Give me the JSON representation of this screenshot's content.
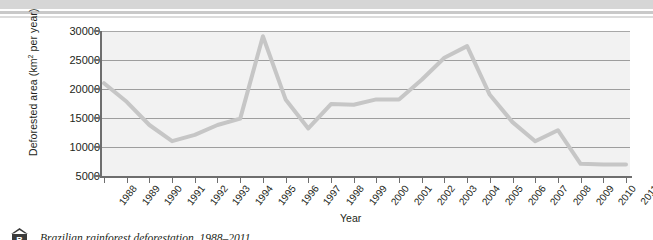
{
  "figure": {
    "badge_letter": "B",
    "caption": "Brazilian rainforest deforestation, 1988–2011",
    "ghost_text": {
      "line1": "ghost-bleed-1",
      "line2": "ghost-bleed-2",
      "line3": "ghost-bleed-3"
    }
  },
  "axes": {
    "y_title_main": "Deforested area (km",
    "y_title_sup": "2",
    "y_title_tail": " per year)",
    "x_title": "Year"
  },
  "colors": {
    "line": "#c6c6c6",
    "plot_background": "#f2f2f2",
    "gridline": "#9e9e9e",
    "axis": "#6e6e6e",
    "text": "#231f20",
    "badge": "#3b3b3b",
    "page_rule": "#d6d6d6"
  },
  "chart_data": {
    "type": "line",
    "title": "Brazilian rainforest deforestation, 1988–2011",
    "xlabel": "Year",
    "ylabel": "Deforested area (km² per year)",
    "ylim": [
      5000,
      30000
    ],
    "ytick_labels": [
      "30000",
      "25000",
      "20000",
      "15000",
      "10000",
      "5000"
    ],
    "yticks": [
      30000,
      25000,
      20000,
      15000,
      10000,
      5000
    ],
    "grid": true,
    "legend": "none",
    "categories": [
      "1988",
      "1989",
      "1990",
      "1991",
      "1992",
      "1993",
      "1994",
      "1995",
      "1996",
      "1997",
      "1998",
      "1999",
      "2000",
      "2001",
      "2002",
      "2003",
      "2004",
      "2005",
      "2006",
      "2007",
      "2008",
      "2009",
      "2010",
      "2011"
    ],
    "values": [
      21000,
      17800,
      13800,
      11000,
      12100,
      13800,
      14900,
      29100,
      18200,
      13200,
      17400,
      17300,
      18200,
      18200,
      21600,
      25400,
      27400,
      19000,
      14300,
      11000,
      12900,
      7100,
      7000,
      7000
    ]
  }
}
